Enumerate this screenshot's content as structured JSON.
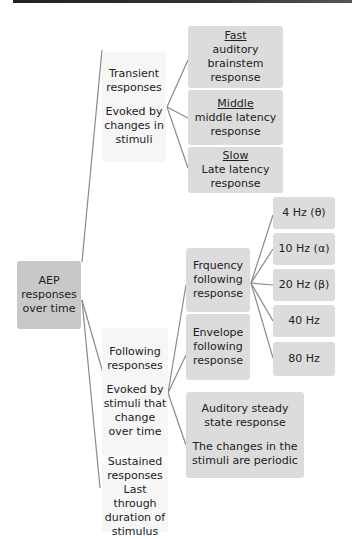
{
  "diagram": {
    "root": {
      "label": "AEP responses over time"
    },
    "transient": {
      "title": "Transient responses",
      "description": "Evoked by changes in stimuli",
      "children": [
        {
          "heading": "Fast",
          "label": "auditory brainstem response"
        },
        {
          "heading": "Middle",
          "label": "middle latency response"
        },
        {
          "heading": "Slow",
          "label": "Late latency response"
        }
      ]
    },
    "following": {
      "title": "Following responses",
      "description": "Evoked by stimuli that change over time",
      "children": [
        {
          "label": "Frquency following response"
        },
        {
          "label": "Envelope following response"
        },
        {
          "label": "Auditory steady state response",
          "description": "The changes in the stimuli are periodic"
        }
      ],
      "frequencies": [
        "4 Hz (θ)",
        "10 Hz (α)",
        "20 Hz (β)",
        "40 Hz",
        "80 Hz"
      ]
    },
    "sustained": {
      "title": "Sustained responses",
      "description": "Last through duration of stimulus"
    },
    "colors": {
      "box": "#dcdcdc",
      "root_box": "#c8c8c8",
      "text_box": "#f6f6f6",
      "line": "#888888",
      "top_bar": "#2a2a2a"
    }
  }
}
